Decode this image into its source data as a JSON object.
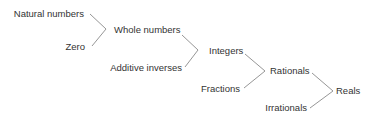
{
  "diagram": {
    "type": "number-set-hierarchy",
    "nodes": {
      "natural_numbers": "Natural numbers",
      "zero": "Zero",
      "whole_numbers": "Whole numbers",
      "additive_inverses": "Additive inverses",
      "integers": "Integers",
      "fractions": "Fractions",
      "rationals": "Rationals",
      "irrationals": "Irrationals",
      "reals": "Reals"
    },
    "edges": [
      {
        "from": [
          "Natural numbers",
          "Zero"
        ],
        "to": "Whole numbers"
      },
      {
        "from": [
          "Whole numbers",
          "Additive inverses"
        ],
        "to": "Integers"
      },
      {
        "from": [
          "Integers",
          "Fractions"
        ],
        "to": "Rationals"
      },
      {
        "from": [
          "Rationals",
          "Irrationals"
        ],
        "to": "Reals"
      }
    ],
    "colors": {
      "text": "#333333",
      "line": "#888888",
      "background": "#ffffff"
    }
  }
}
